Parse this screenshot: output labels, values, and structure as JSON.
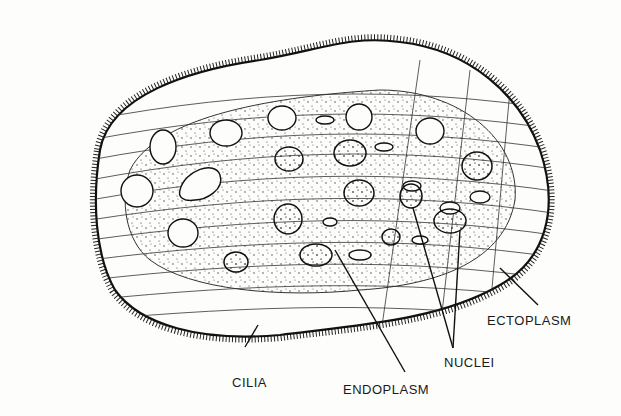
{
  "diagram": {
    "labels": {
      "cilia": "CILIA",
      "endoplasm": "ENDOPLASM",
      "nuclei": "NUCLEI",
      "ectoplasm": "ECTOPLASM"
    },
    "colors": {
      "ink": "#1a1a1a",
      "background": "#fdfdfb"
    }
  }
}
